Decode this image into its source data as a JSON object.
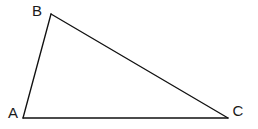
{
  "figure": {
    "type": "geometry-diagram",
    "shape_name": "triangle",
    "background_color": "#ffffff",
    "stroke_color": "#111111",
    "label_color": "#1a1a1a",
    "canvas": {
      "width": 258,
      "height": 129
    },
    "vertices": [
      {
        "id": "A",
        "label": "A",
        "x": 23,
        "y": 118,
        "label_x": 13,
        "label_y": 118
      },
      {
        "id": "B",
        "label": "B",
        "x": 51,
        "y": 14,
        "label_x": 37,
        "label_y": 16
      },
      {
        "id": "C",
        "label": "C",
        "x": 228,
        "y": 118,
        "label_x": 238,
        "label_y": 116
      }
    ],
    "edges": [
      {
        "id": "AB",
        "from": "A",
        "to": "B",
        "path": "M 23 118 L 51 14"
      },
      {
        "id": "BC",
        "from": "B",
        "to": "C",
        "path": "M 51 14 L 228 118"
      },
      {
        "id": "CA",
        "from": "C",
        "to": "A",
        "path": "M 228 118 L 23 118"
      }
    ]
  }
}
